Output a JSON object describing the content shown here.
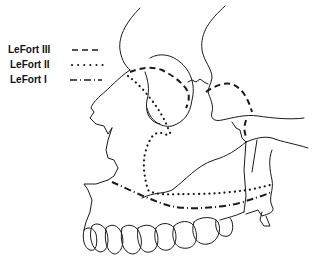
{
  "diagram": {
    "type": "anatomical-line-drawing",
    "stroke_color": "#1a1a1a",
    "background": "#ffffff"
  },
  "legend": {
    "items": [
      {
        "label": "LeFort III",
        "line_style": "dashed"
      },
      {
        "label": "LeFort II",
        "line_style": "dotted"
      },
      {
        "label": "LeFort I",
        "line_style": "dash-dot"
      }
    ]
  }
}
